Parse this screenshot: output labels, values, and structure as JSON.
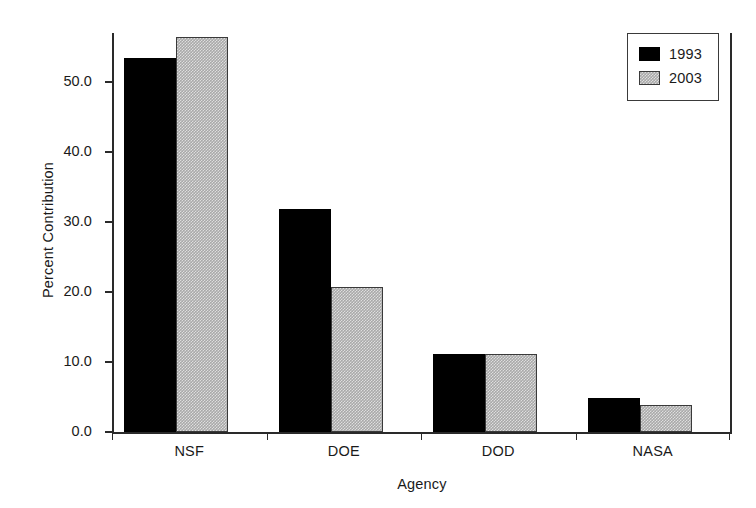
{
  "chart_data": {
    "type": "bar",
    "title": "",
    "xlabel": "Agency",
    "ylabel": "Percent Contribution",
    "categories": [
      "NSF",
      "DOE",
      "DOD",
      "NASA"
    ],
    "series": [
      {
        "name": "1993",
        "color": "#000000",
        "values": [
          53.4,
          31.8,
          11.2,
          4.8
        ]
      },
      {
        "name": "2003",
        "color": "#a9a9a9",
        "values": [
          56.4,
          20.7,
          11.2,
          3.9
        ]
      }
    ],
    "ylim": [
      0.0,
      57.0
    ],
    "yticks": [
      0.0,
      10.0,
      20.0,
      30.0,
      40.0,
      50.0
    ],
    "ytick_labels": [
      "0.0",
      "10.0",
      "20.0",
      "30.0",
      "40.0",
      "50.0"
    ],
    "grid": false,
    "legend_position": "top-right",
    "legend_entries": [
      "1993",
      "2003"
    ]
  }
}
